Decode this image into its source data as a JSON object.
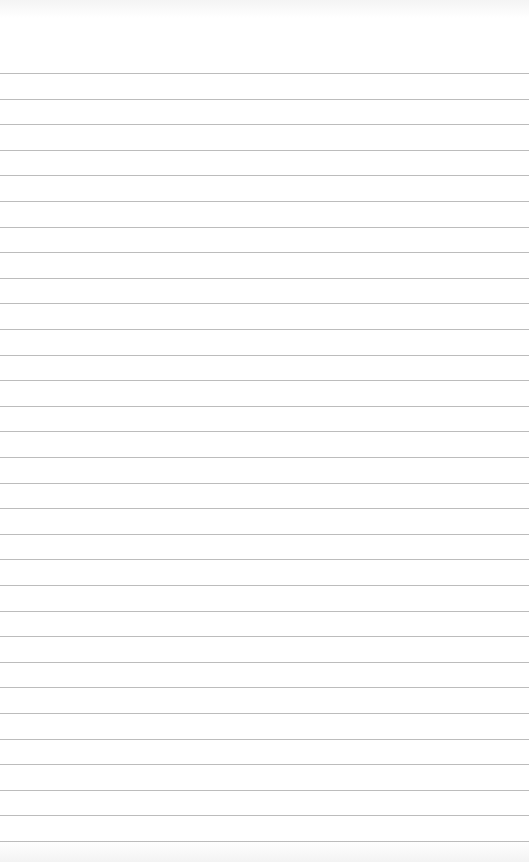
{
  "paper": {
    "type": "ruled-lined-paper",
    "line_count": 31,
    "first_line_y": 73,
    "line_spacing": 25.6,
    "line_color": "#bcbcbc",
    "background_color": "#ffffff"
  }
}
